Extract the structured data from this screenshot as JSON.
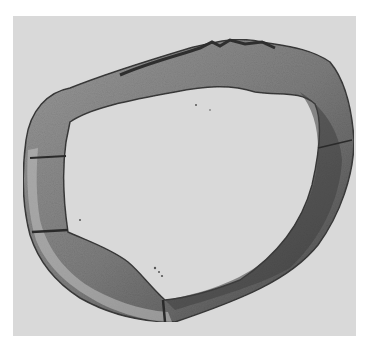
{
  "image": {
    "kind": "grayscale micrograph",
    "subject": "cross-section of ring-shaped tissue (vessel wall)",
    "background_color": "#ffffff",
    "panel_color": "#d9d9d9",
    "tissue_light": "#a8a8a8",
    "tissue_mid": "#7a7a7a",
    "tissue_dark": "#3c3c3c"
  }
}
